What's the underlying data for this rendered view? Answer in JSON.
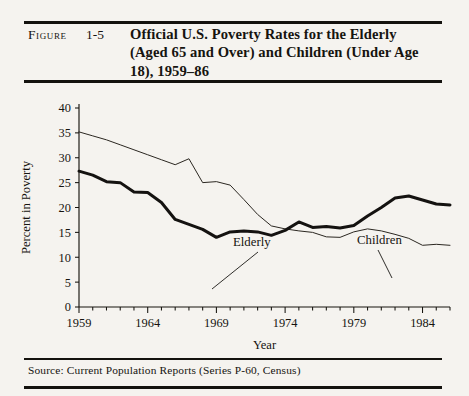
{
  "figure": {
    "label": "Figure",
    "number": "1-5",
    "title": "Official U.S. Poverty Rates for the Elderly (Aged 65 and Over) and Children (Under Age 18), 1959–86",
    "source": "Source: Current Population Reports (Series P-60, Census)"
  },
  "chart_data": {
    "type": "line",
    "title": "Official U.S. Poverty Rates for the Elderly (Aged 65 and Over) and Children (Under Age 18), 1959–86",
    "xlabel": "Year",
    "ylabel": "Percent in Poverty",
    "xlim": [
      1959,
      1986
    ],
    "ylim": [
      0,
      40
    ],
    "yticks": [
      0,
      5,
      10,
      15,
      20,
      25,
      30,
      35,
      40
    ],
    "ytick_labels": [
      "0",
      "5",
      "10",
      "15",
      "20",
      "25",
      "30",
      "35",
      "40"
    ],
    "xticks": [
      1959,
      1964,
      1969,
      1974,
      1979,
      1984
    ],
    "xtick_labels": [
      "1959",
      "1964",
      "1969",
      "1974",
      "1979",
      "1984"
    ],
    "minor_xticks_every": 1,
    "grid": false,
    "legend": "inline-annotations",
    "x": [
      1959,
      1960,
      1961,
      1962,
      1963,
      1964,
      1965,
      1966,
      1967,
      1968,
      1969,
      1970,
      1971,
      1972,
      1973,
      1974,
      1975,
      1976,
      1977,
      1978,
      1979,
      1980,
      1981,
      1982,
      1983,
      1984,
      1985,
      1986
    ],
    "series": [
      {
        "name": "Elderly",
        "style": "thin",
        "values": [
          35.2,
          34.4,
          33.6,
          32.6,
          31.6,
          30.6,
          29.6,
          28.6,
          29.8,
          25.0,
          25.2,
          24.5,
          21.6,
          18.6,
          16.3,
          15.7,
          15.3,
          15.0,
          14.1,
          14.0,
          15.1,
          15.7,
          15.3,
          14.6,
          13.8,
          12.4,
          12.6,
          12.4
        ]
      },
      {
        "name": "Children",
        "style": "thick",
        "values": [
          27.3,
          26.5,
          25.2,
          25.0,
          23.1,
          23.0,
          21.0,
          17.6,
          16.6,
          15.6,
          14.0,
          15.1,
          15.3,
          15.1,
          14.4,
          15.4,
          17.1,
          16.0,
          16.2,
          15.9,
          16.4,
          18.3,
          20.0,
          21.9,
          22.3,
          21.5,
          20.7,
          20.5
        ]
      }
    ],
    "annotations": [
      {
        "text": "Elderly",
        "series": "Elderly",
        "anchor_year": 1974
      },
      {
        "text": "Children",
        "series": "Children",
        "anchor_year": 1983
      }
    ]
  }
}
